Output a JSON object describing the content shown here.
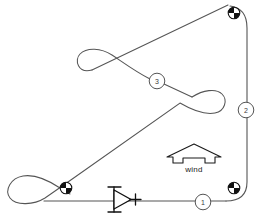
{
  "diagram": {
    "type": "sailing-race-course",
    "background_color": "#ffffff",
    "line_color": "#555555",
    "mark_color": "#000000",
    "legs": [
      {
        "number": "1",
        "cx": 203,
        "cy": 202,
        "r": 8
      },
      {
        "number": "2",
        "cx": 246,
        "cy": 110,
        "r": 8
      },
      {
        "number": "3",
        "cx": 157,
        "cy": 81,
        "r": 8
      }
    ],
    "marks": [
      {
        "name": "mark-top-right",
        "cx": 234,
        "cy": 13,
        "r": 6
      },
      {
        "name": "mark-bottom-right",
        "cx": 234,
        "cy": 188,
        "r": 6
      },
      {
        "name": "mark-bottom-left",
        "cx": 66,
        "cy": 188,
        "r": 6
      }
    ],
    "wind": {
      "label": "wind",
      "label_x": 194,
      "label_y": 168,
      "direction": "up",
      "apex_x": 194,
      "apex_y": 144
    },
    "start": {
      "name": "committee-boat",
      "x": 114,
      "y": 199,
      "plus_x": 135,
      "plus_y": 199
    },
    "course_path": "M 66 201 L 225 201 Q 248 201 248 184 L 248 30 Q 248 8 232 8 L 70 191 Q 60 196 66 201",
    "loops": [
      {
        "name": "loop-upper-left",
        "cx": 104,
        "cy": 66
      },
      {
        "name": "loop-lower-right",
        "cx": 203,
        "cy": 98
      },
      {
        "name": "loop-bottom-left",
        "cx": 30,
        "cy": 189
      }
    ]
  }
}
